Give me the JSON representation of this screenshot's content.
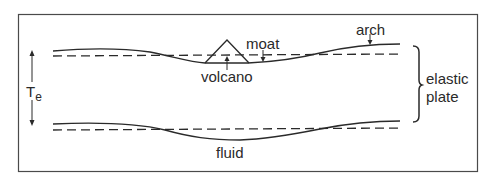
{
  "labels": {
    "arch": "arch",
    "moat": "moat",
    "volcano": "volcano",
    "te_main": "T",
    "te_sub": "e",
    "elastic": "elastic",
    "plate": "plate",
    "fluid": "fluid"
  },
  "colors": {
    "line": "#2a2a2a",
    "frame": "#4a4a4a",
    "background": "#ffffff"
  }
}
